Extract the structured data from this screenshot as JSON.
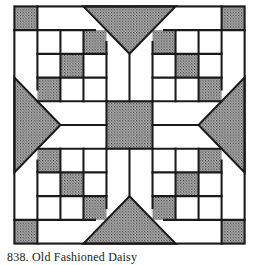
{
  "figure": {
    "title": "838. Old Fashioned Daisy",
    "grid_units": 10,
    "colors": {
      "line": "#1a1a1a",
      "fill_light": "#ffffff",
      "fill_dark": "#8a8a8a"
    },
    "shaded_squares": [
      [
        0,
        0
      ],
      [
        9,
        0
      ],
      [
        0,
        9
      ],
      [
        9,
        9
      ],
      [
        3,
        1
      ],
      [
        2,
        2
      ],
      [
        1,
        3
      ],
      [
        6,
        1
      ],
      [
        7,
        2
      ],
      [
        8,
        3
      ],
      [
        1,
        6
      ],
      [
        2,
        7
      ],
      [
        3,
        8
      ],
      [
        8,
        6
      ],
      [
        7,
        7
      ],
      [
        6,
        8
      ]
    ],
    "center_square": [
      4,
      4,
      2,
      2
    ],
    "triangles": [
      [
        [
          3,
          0
        ],
        [
          7,
          0
        ],
        [
          5,
          2
        ]
      ],
      [
        [
          0,
          3
        ],
        [
          0,
          7
        ],
        [
          2,
          5
        ]
      ],
      [
        [
          10,
          3
        ],
        [
          10,
          7
        ],
        [
          8,
          5
        ]
      ],
      [
        [
          3,
          10
        ],
        [
          7,
          10
        ],
        [
          5,
          8
        ]
      ]
    ]
  }
}
